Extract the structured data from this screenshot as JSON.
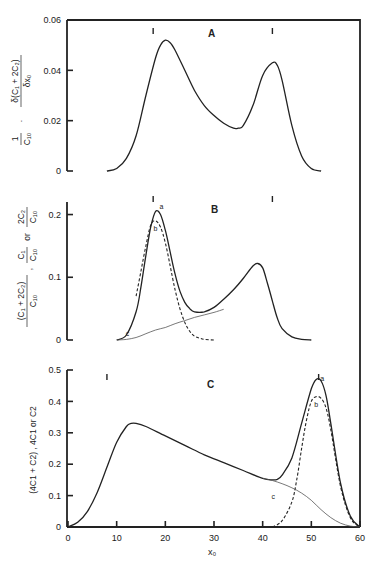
{
  "figure": {
    "x_axis": {
      "label": "x₀",
      "ticks": [
        0,
        10,
        20,
        30,
        40,
        50,
        60
      ],
      "range": [
        0,
        60
      ]
    }
  },
  "chart_data": [
    {
      "type": "line",
      "panel": "A",
      "title": "A",
      "ylabel": "1/C10 · δ(C1 + 2C2)/δx0",
      "ylabel_parts": {
        "prefix": "1",
        "prefix_den": "C₁₀",
        "num": "δ(C₁ + 2C₂)",
        "den": "δx₀"
      },
      "xlabel": "x₀",
      "ylim": [
        0,
        0.06
      ],
      "yticks": [
        0,
        0.02,
        0.04,
        0.06
      ],
      "ytick_labels": [
        "0",
        "0.02",
        "0.04",
        "0.06"
      ],
      "markers_x": [
        17.5,
        42
      ],
      "series": [
        {
          "name": "distribution",
          "style": "solid",
          "x": [
            8,
            10,
            12,
            14,
            16,
            18,
            19,
            20,
            21,
            22,
            24,
            26,
            28,
            30,
            32,
            34,
            35,
            36,
            38,
            40,
            42,
            43,
            44,
            46,
            48,
            50,
            52
          ],
          "y": [
            0.0,
            0.001,
            0.005,
            0.014,
            0.03,
            0.045,
            0.05,
            0.052,
            0.051,
            0.048,
            0.04,
            0.032,
            0.026,
            0.022,
            0.019,
            0.017,
            0.017,
            0.018,
            0.026,
            0.038,
            0.043,
            0.042,
            0.036,
            0.018,
            0.006,
            0.001,
            0.0
          ]
        }
      ]
    },
    {
      "type": "line",
      "panel": "B",
      "title": "B",
      "ylabel": "(C1 + 2C2)/C10 , C1/C10 or 2C2/C10",
      "ylabel_parts": {
        "a_num": "(C₁ + 2C₂)",
        "a_den": "C₁₀",
        "b_num": "C₁",
        "b_den": "C₁₀",
        "sep": ",",
        "or": "or",
        "c_num": "2C₂",
        "c_den": "C₁₀"
      },
      "xlabel": "x₀",
      "ylim": [
        0,
        0.22
      ],
      "yticks": [
        0,
        0.1,
        0.2
      ],
      "ytick_labels": [
        "0",
        "0.1",
        "0.2"
      ],
      "markers_x": [
        17.5,
        42
      ],
      "curve_labels": [
        "a",
        "b",
        "c"
      ],
      "series": [
        {
          "name": "a",
          "style": "solid",
          "x": [
            10,
            12,
            14,
            15,
            16,
            17,
            18,
            19,
            20,
            21,
            22,
            23,
            24,
            25,
            26,
            28,
            30,
            32,
            34,
            36,
            38,
            39,
            40,
            41,
            42,
            43,
            44,
            46,
            48,
            50
          ],
          "y": [
            0.0,
            0.008,
            0.045,
            0.085,
            0.135,
            0.18,
            0.205,
            0.2,
            0.175,
            0.14,
            0.105,
            0.078,
            0.06,
            0.05,
            0.045,
            0.045,
            0.052,
            0.065,
            0.08,
            0.098,
            0.118,
            0.122,
            0.115,
            0.09,
            0.062,
            0.035,
            0.018,
            0.005,
            0.001,
            0.0
          ]
        },
        {
          "name": "b",
          "style": "dashed",
          "x": [
            14,
            15,
            16,
            17,
            18,
            19,
            20,
            21,
            22,
            23,
            24,
            25,
            26,
            27,
            28,
            30
          ],
          "y": [
            0.07,
            0.11,
            0.15,
            0.183,
            0.19,
            0.18,
            0.155,
            0.118,
            0.08,
            0.05,
            0.028,
            0.014,
            0.006,
            0.003,
            0.001,
            0.0
          ]
        },
        {
          "name": "c",
          "style": "thin",
          "x": [
            10,
            12,
            14,
            16,
            18,
            20,
            22,
            24,
            26,
            28,
            30,
            32
          ],
          "y": [
            0.0,
            0.001,
            0.004,
            0.01,
            0.016,
            0.02,
            0.026,
            0.031,
            0.036,
            0.04,
            0.044,
            0.049
          ]
        }
      ]
    },
    {
      "type": "line",
      "panel": "C",
      "title": "C",
      "ylabel": "(4C1 + C2) , 4C1 or C2",
      "xlabel": "x₀",
      "ylim": [
        0,
        0.5
      ],
      "yticks": [
        0,
        0.1,
        0.2,
        0.3,
        0.4,
        0.5
      ],
      "ytick_labels": [
        "0",
        "0.1",
        "0.2",
        "0.3",
        "0.4",
        "0.5"
      ],
      "markers_x": [
        8,
        51.5
      ],
      "curve_labels": [
        "a",
        "b",
        "c"
      ],
      "series": [
        {
          "name": "a",
          "style": "solid",
          "x": [
            0,
            2,
            4,
            6,
            8,
            10,
            12,
            13,
            14,
            16,
            20,
            24,
            28,
            32,
            36,
            40,
            42,
            43,
            44,
            46,
            48,
            50,
            51,
            52,
            53,
            54,
            56,
            58,
            60
          ],
          "y": [
            0.0,
            0.015,
            0.05,
            0.11,
            0.19,
            0.27,
            0.32,
            0.33,
            0.33,
            0.32,
            0.29,
            0.26,
            0.23,
            0.205,
            0.18,
            0.155,
            0.15,
            0.152,
            0.165,
            0.22,
            0.33,
            0.44,
            0.47,
            0.465,
            0.42,
            0.33,
            0.14,
            0.035,
            0.0
          ]
        },
        {
          "name": "b",
          "style": "dashed",
          "x": [
            42,
            44,
            46,
            47,
            48,
            49,
            50,
            51,
            52,
            53,
            54,
            56,
            58,
            60
          ],
          "y": [
            0.0,
            0.02,
            0.08,
            0.15,
            0.25,
            0.34,
            0.4,
            0.415,
            0.41,
            0.38,
            0.31,
            0.13,
            0.03,
            0.0
          ]
        },
        {
          "name": "c",
          "style": "thin",
          "x": [
            40,
            42,
            44,
            46,
            48,
            50,
            52,
            54,
            56,
            58,
            60
          ],
          "y": [
            0.155,
            0.148,
            0.138,
            0.125,
            0.108,
            0.085,
            0.055,
            0.03,
            0.012,
            0.003,
            0.0
          ]
        }
      ]
    }
  ]
}
